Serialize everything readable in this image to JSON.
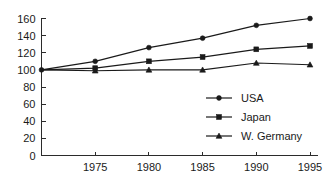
{
  "chart_data": {
    "type": "line",
    "title": "",
    "xlabel": "",
    "ylabel": "",
    "x": [
      1970,
      1975,
      1980,
      1985,
      1990,
      1995
    ],
    "x_tick_labels": [
      "",
      "1975",
      "1980",
      "1985",
      "1990",
      "1995"
    ],
    "y_tick_labels": [
      "0",
      "20",
      "40",
      "60",
      "80",
      "100",
      "120",
      "140",
      "160"
    ],
    "y_ticks": [
      0,
      20,
      40,
      60,
      80,
      100,
      120,
      140,
      160
    ],
    "ylim": [
      0,
      160
    ],
    "xlim": [
      1970,
      1995
    ],
    "grid": false,
    "legend_position": "bottom-right",
    "series": [
      {
        "name": "USA",
        "marker": "circle",
        "color": "#1a1a1a",
        "values": [
          100,
          110,
          126,
          137,
          152,
          160
        ]
      },
      {
        "name": "Japan",
        "marker": "square",
        "color": "#1a1a1a",
        "values": [
          100,
          102,
          110,
          115,
          124,
          128
        ]
      },
      {
        "name": "W. Germany",
        "marker": "triangle",
        "color": "#1a1a1a",
        "values": [
          100,
          99,
          100,
          100,
          108,
          106
        ]
      }
    ]
  },
  "legend": {
    "items": [
      {
        "label": "USA",
        "marker": "circle"
      },
      {
        "label": "Japan",
        "marker": "square"
      },
      {
        "label": "W. Germany",
        "marker": "triangle"
      }
    ]
  },
  "axes": {
    "y_labels": [
      "160",
      "140",
      "120",
      "100",
      "80",
      "60",
      "40",
      "20",
      "0"
    ],
    "x_labels": [
      "1975",
      "1980",
      "1985",
      "1990",
      "1995"
    ]
  }
}
